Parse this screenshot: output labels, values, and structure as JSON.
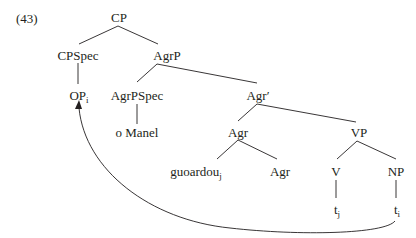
{
  "example_number": "(43)",
  "nodes": {
    "cp": {
      "label": "CP"
    },
    "cpspec": {
      "label": "CPSpec"
    },
    "agrp": {
      "label": "AgrP"
    },
    "op": {
      "label": "OP",
      "sub": "i"
    },
    "agrpspec": {
      "label": "AgrPSpec"
    },
    "agrbar": {
      "label": "Agr′"
    },
    "omanel": {
      "label": "o Manel"
    },
    "agr": {
      "label": "Agr"
    },
    "vp": {
      "label": "VP"
    },
    "guoardou": {
      "label": "guoardou",
      "sub": "j"
    },
    "agr2": {
      "label": "Agr"
    },
    "v": {
      "label": "V"
    },
    "np": {
      "label": "NP"
    },
    "tj": {
      "label": "t",
      "sub": "j"
    },
    "ti": {
      "label": "t",
      "sub": "i"
    }
  },
  "movement_arrow": {
    "from": "t_i",
    "to": "OP_i"
  },
  "colors": {
    "ink": "#231f20",
    "background": "#ffffff"
  }
}
